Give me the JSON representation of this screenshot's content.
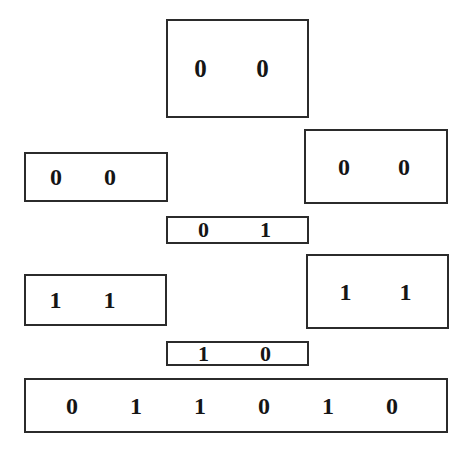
{
  "diagram": {
    "background_color": "#ffffff",
    "border_color": "#2b2b2b",
    "text_color": "#151515",
    "boxes": [
      {
        "id": "box-top",
        "name": "top-bit-box",
        "bits": [
          "0",
          "0"
        ]
      },
      {
        "id": "box-left-a",
        "name": "upper-left-bit-box",
        "bits": [
          "0",
          "0"
        ]
      },
      {
        "id": "box-right-a",
        "name": "upper-right-bit-box",
        "bits": [
          "0",
          "0"
        ]
      },
      {
        "id": "box-mid-a",
        "name": "upper-middle-bit-box",
        "bits": [
          "0",
          "1"
        ]
      },
      {
        "id": "box-left-b",
        "name": "lower-left-bit-box",
        "bits": [
          "1",
          "1"
        ]
      },
      {
        "id": "box-right-b",
        "name": "lower-right-bit-box",
        "bits": [
          "1",
          "1"
        ]
      },
      {
        "id": "box-mid-b",
        "name": "lower-middle-bit-box",
        "bits": [
          "1",
          "0"
        ]
      },
      {
        "id": "box-bottom",
        "name": "bottom-result-bit-box",
        "bits": [
          "0",
          "1",
          "1",
          "0",
          "1",
          "0"
        ]
      }
    ]
  }
}
